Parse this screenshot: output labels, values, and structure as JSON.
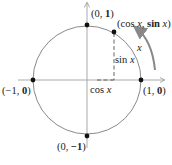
{
  "diagram": {
    "center": [
      87,
      80
    ],
    "radius": 54,
    "colors": {
      "axis": "#a0a0a0",
      "circle": "#8a8a8a",
      "point": "#111111",
      "arrow": "#888888",
      "text": "#222222"
    },
    "points": [
      {
        "id": "top",
        "label_pre": "(0, ",
        "label_bold": "1",
        "label_post": ")"
      },
      {
        "id": "right",
        "label_pre": "(1, ",
        "label_bold": "0",
        "label_post": ")"
      },
      {
        "id": "left",
        "label_pre": "(−1, ",
        "label_bold": "0",
        "label_post": ")"
      },
      {
        "id": "bottom",
        "label_pre": "(0, ",
        "label_bold": "−1",
        "label_post": ")"
      },
      {
        "id": "moving",
        "label_pre": "(cos ",
        "label_x": "x",
        "label_mid": ", ",
        "label_bold": "sin",
        "label_x2": " x",
        "label_post": ")"
      }
    ],
    "annotations": {
      "sin": "sin",
      "cos": "cos",
      "var": "x",
      "arc": "x"
    }
  }
}
